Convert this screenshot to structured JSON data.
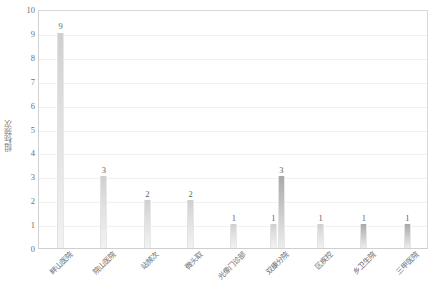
{
  "chart_data": {
    "type": "bar",
    "title": "",
    "xlabel": "",
    "ylabel": "组标频次",
    "ylim": [
      0,
      10
    ],
    "ytick_labels": [
      "10",
      "9",
      "8",
      "7",
      "6",
      "5",
      "4",
      "3",
      "2",
      "1",
      "0"
    ],
    "yticks": [
      10,
      9,
      8,
      7,
      6,
      5,
      4,
      3,
      2,
      1,
      0
    ],
    "grid": true,
    "legend": "none",
    "categories": [
      "畔山医院",
      "院山医院",
      "站频次",
      "微头取",
      "光像门诊部",
      "双康分院",
      "区疾控",
      "乡卫生院",
      "三甲医院"
    ],
    "values": [
      9,
      3,
      2,
      2,
      1,
      3,
      1,
      1,
      1
    ],
    "bars": [
      {
        "category": "畔山医院",
        "value": 9,
        "label": "9",
        "shade": "light"
      },
      {
        "category": "院山医院",
        "value": 3,
        "label": "3",
        "shade": "light"
      },
      {
        "category": "站频次",
        "value": 2,
        "label": "2",
        "shade": "light"
      },
      {
        "category": "微头取",
        "value": 2,
        "label": "2",
        "shade": "light"
      },
      {
        "category": "光像门诊部",
        "value": 1,
        "label": "1",
        "shade": "light"
      },
      {
        "category": "双康分院",
        "value": 1,
        "label": "1",
        "shade": "light",
        "paired": true
      },
      {
        "category": "双康分院",
        "value": 3,
        "label": "3",
        "shade": "dark",
        "paired": true
      },
      {
        "category": "区疾控",
        "value": 1,
        "label": "1",
        "shade": "light"
      },
      {
        "category": "乡卫生院",
        "value": 1,
        "label": "1",
        "shade": "dark"
      },
      {
        "category": "三甲医院",
        "value": 1,
        "label": "1",
        "shade": "dark"
      }
    ],
    "colors": {
      "bar_light": "#dedede",
      "bar_dark": "#b4b4b4",
      "gridline": "#f0f0f0",
      "axis": "#d2d2d2",
      "text": "#6d6d6d"
    }
  }
}
